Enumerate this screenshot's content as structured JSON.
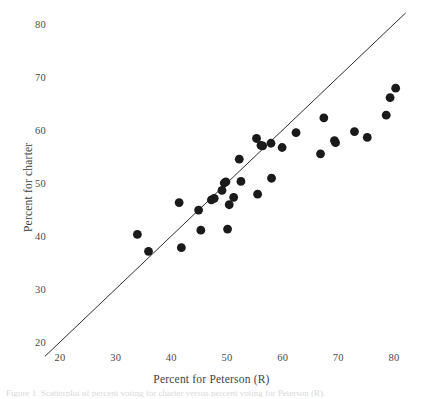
{
  "chart_data": {
    "type": "scatter",
    "title": "",
    "xlabel": "Percent for Peterson (R)",
    "ylabel": "Percent for charter",
    "xlim": [
      17,
      82
    ],
    "ylim": [
      17,
      82
    ],
    "xticks": [
      20,
      30,
      40,
      50,
      60,
      70,
      80
    ],
    "yticks": [
      20,
      30,
      40,
      50,
      60,
      70,
      80
    ],
    "grid": false,
    "legend": "none",
    "marker_color": "#1a1a1a",
    "marker_size": 4.4,
    "reference_line": {
      "name": "identity-line",
      "description": "45 degree y = x line",
      "x": [
        17.3,
        82.1
      ],
      "y": [
        17.3,
        82.1
      ],
      "color": "#2e2e2e",
      "width": 1
    },
    "points": [
      {
        "x": 33.9,
        "y": 40.3
      },
      {
        "x": 35.9,
        "y": 37.1
      },
      {
        "x": 41.4,
        "y": 46.3
      },
      {
        "x": 41.8,
        "y": 37.8
      },
      {
        "x": 44.9,
        "y": 44.9
      },
      {
        "x": 45.3,
        "y": 41.1
      },
      {
        "x": 47.2,
        "y": 46.8
      },
      {
        "x": 47.7,
        "y": 47.1
      },
      {
        "x": 49.1,
        "y": 48.6
      },
      {
        "x": 49.5,
        "y": 50.0
      },
      {
        "x": 49.8,
        "y": 50.2
      },
      {
        "x": 50.1,
        "y": 41.3
      },
      {
        "x": 50.4,
        "y": 45.9
      },
      {
        "x": 51.2,
        "y": 47.3
      },
      {
        "x": 52.2,
        "y": 54.5
      },
      {
        "x": 52.5,
        "y": 50.3
      },
      {
        "x": 55.3,
        "y": 58.4
      },
      {
        "x": 55.5,
        "y": 47.9
      },
      {
        "x": 56.1,
        "y": 57.1
      },
      {
        "x": 56.4,
        "y": 57.0
      },
      {
        "x": 57.9,
        "y": 57.5
      },
      {
        "x": 58.0,
        "y": 50.9
      },
      {
        "x": 59.9,
        "y": 56.7
      },
      {
        "x": 62.4,
        "y": 59.5
      },
      {
        "x": 66.8,
        "y": 55.5
      },
      {
        "x": 67.4,
        "y": 62.3
      },
      {
        "x": 69.3,
        "y": 58.0
      },
      {
        "x": 69.5,
        "y": 57.6
      },
      {
        "x": 72.9,
        "y": 59.7
      },
      {
        "x": 75.2,
        "y": 58.6
      },
      {
        "x": 78.6,
        "y": 62.8
      },
      {
        "x": 79.3,
        "y": 66.1
      },
      {
        "x": 80.3,
        "y": 67.9
      }
    ]
  },
  "caption_sliver": "Figure 1. Scatterplot of percent voting for charter versus percent voting for Peterson (R)."
}
